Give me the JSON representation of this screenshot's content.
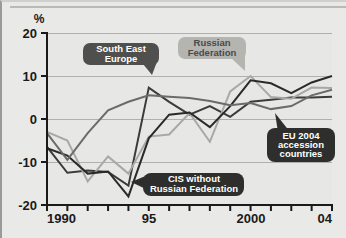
{
  "chart_data": {
    "type": "line",
    "title": "",
    "subtitle": "",
    "xlabel": "",
    "ylabel": "%",
    "ylim": [
      -20,
      20
    ],
    "xlim": [
      1990,
      2004
    ],
    "yticks": [
      20,
      10,
      0,
      -10,
      -20
    ],
    "ytick_labels": [
      "20",
      "10",
      "0",
      "-10",
      "-20"
    ],
    "xticks": [
      1990,
      1991,
      1992,
      1993,
      1994,
      1995,
      1996,
      1997,
      1998,
      1999,
      2000,
      2001,
      2002,
      2003,
      2004
    ],
    "xtick_labels": [
      "1990",
      "",
      "",
      "",
      "",
      "95",
      "",
      "",
      "",
      "",
      "2000",
      "",
      "",
      "",
      "04"
    ],
    "grid": "horizontal",
    "legend": "callout-labels",
    "x": [
      1990,
      1991,
      1992,
      1993,
      1994,
      1995,
      1996,
      1997,
      1998,
      1999,
      2000,
      2001,
      2002,
      2003,
      2004
    ],
    "series": [
      {
        "name": "South East Europe",
        "color": "#3b3b3b",
        "values": [
          -6.5,
          -12.5,
          -12.0,
          -12.3,
          -15.5,
          7.3,
          4.0,
          1.0,
          3.0,
          0.5,
          4.0,
          4.5,
          5.0,
          5.0,
          5.2
        ]
      },
      {
        "name": "Russian Federation",
        "color": "#a8a8a6",
        "values": [
          -3.0,
          -5.0,
          -14.5,
          -8.7,
          -12.7,
          -4.1,
          -3.6,
          1.4,
          -5.3,
          6.4,
          10.0,
          5.1,
          4.7,
          7.3,
          7.2
        ]
      },
      {
        "name": "CIS without Russian Federation",
        "color": "#2a2a2a",
        "values": [
          -6.8,
          -8.5,
          -12.7,
          -12.2,
          -18.0,
          -4.5,
          1.0,
          1.5,
          -1.9,
          3.0,
          9.0,
          8.3,
          6.0,
          8.5,
          10.0
        ]
      },
      {
        "name": "EU 2004 accession countries",
        "color": "#6b6b69",
        "values": [
          -3.3,
          -9.5,
          -3.3,
          2.0,
          4.0,
          5.5,
          5.2,
          4.9,
          4.2,
          3.2,
          3.7,
          2.3,
          3.0,
          5.5,
          6.8
        ]
      }
    ],
    "annotations": [
      {
        "label": "South East Europe",
        "lines": [
          "South East",
          "Europe"
        ],
        "style": "dark",
        "text_color": "#ffffff",
        "bubble_color": "#4f4f4d"
      },
      {
        "label": "Russian Federation",
        "lines": [
          "Russian",
          "Federation"
        ],
        "style": "light",
        "text_color": "#5a5a58",
        "bubble_color": "#b4b4b1"
      },
      {
        "label": "EU 2004 accession countries",
        "lines": [
          "EU 2004",
          "accession",
          "countries"
        ],
        "style": "dark",
        "text_color": "#ffffff",
        "bubble_color": "#2e2e2c"
      },
      {
        "label": "CIS without Russian Federation",
        "lines": [
          "CIS without",
          "Russian Federation"
        ],
        "style": "dark",
        "text_color": "#ffffff",
        "bubble_color": "#2e2e2c"
      }
    ]
  },
  "axis": {
    "unit_label": "%",
    "y_labels": [
      "20",
      "10",
      "0",
      "-10",
      "-20"
    ],
    "x_labels": [
      "1990",
      "95",
      "2000",
      "04"
    ]
  },
  "colors": {
    "background": "#e9e9e7",
    "plot_background": "#e7e7e5",
    "gridline": "#b0b0ad",
    "axis": "#1a1a1a"
  }
}
